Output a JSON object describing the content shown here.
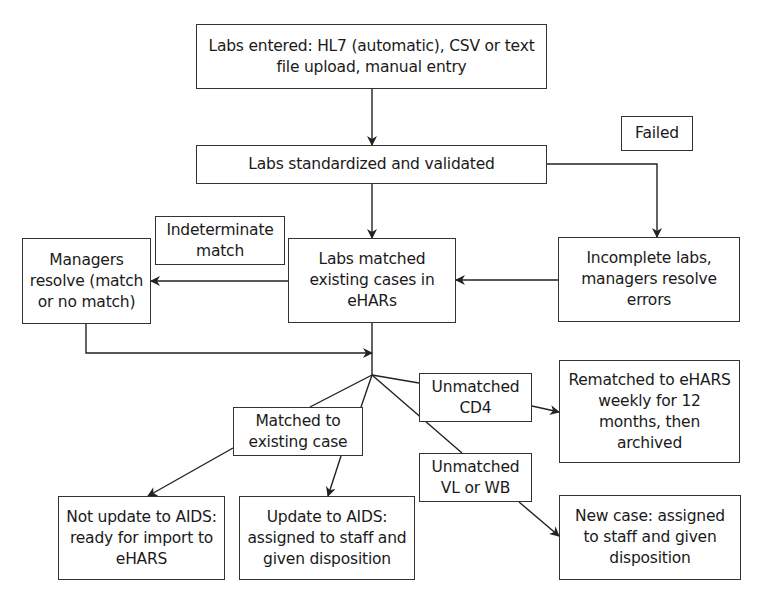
{
  "diagram": {
    "type": "flowchart",
    "nodes": {
      "labs_entered": {
        "text": "Labs entered: HL7 (automatic), CSV or text file upload, manual entry"
      },
      "standardized": {
        "text": "Labs standardized and validated"
      },
      "failed_label": {
        "text": "Failed"
      },
      "incomplete": {
        "text": "Incomplete labs, managers resolve errors"
      },
      "labs_matched": {
        "text": "Labs matched existing cases in eHARs"
      },
      "indeterminate_label": {
        "text": "Indeterminate match"
      },
      "managers_resolve": {
        "text": "Managers resolve (match or no match)"
      },
      "matched_existing": {
        "text": "Matched to existing case"
      },
      "unmatched_cd4": {
        "text": "Unmatched CD4"
      },
      "unmatched_vl_wb": {
        "text": "Unmatched VL or WB"
      },
      "rematched": {
        "text": "Rematched to eHARS weekly for 12 months, then archived"
      },
      "not_update_aids": {
        "text": "Not update to AIDS: ready for import to eHARS"
      },
      "update_aids": {
        "text": "Update to AIDS: assigned to staff and given disposition"
      },
      "new_case": {
        "text": "New case: assigned to staff and given disposition"
      }
    },
    "edges": [
      {
        "from": "labs_entered",
        "to": "standardized",
        "label": ""
      },
      {
        "from": "standardized",
        "to": "labs_matched",
        "label": ""
      },
      {
        "from": "standardized",
        "to": "incomplete",
        "label": "Failed"
      },
      {
        "from": "incomplete",
        "to": "labs_matched",
        "label": ""
      },
      {
        "from": "labs_matched",
        "to": "managers_resolve",
        "label": "Indeterminate match"
      },
      {
        "from": "managers_resolve",
        "to": "branch_point",
        "label": ""
      },
      {
        "from": "labs_matched",
        "to": "matched_existing",
        "label": ""
      },
      {
        "from": "labs_matched",
        "to": "unmatched_cd4",
        "label": ""
      },
      {
        "from": "labs_matched",
        "to": "unmatched_vl_wb",
        "label": ""
      },
      {
        "from": "matched_existing",
        "to": "not_update_aids",
        "label": ""
      },
      {
        "from": "matched_existing",
        "to": "update_aids",
        "label": ""
      },
      {
        "from": "unmatched_cd4",
        "to": "rematched",
        "label": ""
      },
      {
        "from": "unmatched_vl_wb",
        "to": "new_case",
        "label": ""
      }
    ]
  },
  "colors": {
    "line": "#222222",
    "border": "#333333",
    "background": "#ffffff",
    "text": "#1a1a1a"
  }
}
